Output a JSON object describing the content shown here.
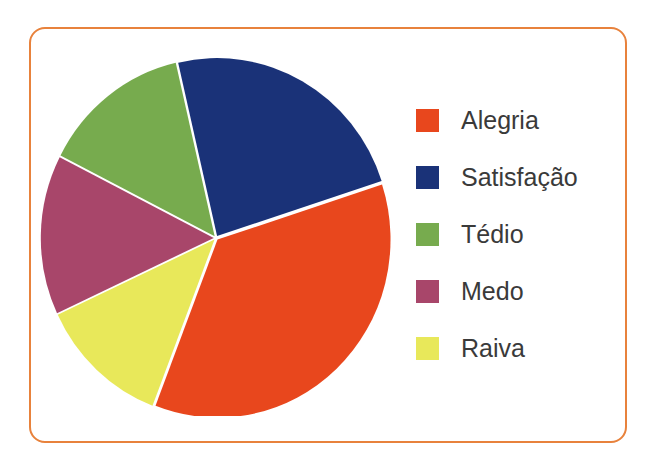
{
  "frame": {
    "border_color": "#e8823c",
    "background": "#ffffff"
  },
  "legend": {
    "items": [
      {
        "label": "Alegria",
        "color": "#e8471d"
      },
      {
        "label": "Satisfação",
        "color": "#1a3278"
      },
      {
        "label": "Tédio",
        "color": "#77ab4e"
      },
      {
        "label": "Medo",
        "color": "#a8466a"
      },
      {
        "label": "Raiva",
        "color": "#e8e85a"
      }
    ]
  },
  "chart_data": {
    "type": "pie",
    "title": "",
    "subtitle": "",
    "xlabel": "",
    "ylabel": "",
    "legend_position": "right",
    "grid": false,
    "labels": [
      "Alegria",
      "Satisfação",
      "Tédio",
      "Medo",
      "Raiva"
    ],
    "colors": [
      "#e8471d",
      "#1a3278",
      "#77ab4e",
      "#a8466a",
      "#e8e85a"
    ],
    "values": [
      36,
      24,
      14,
      15,
      12
    ],
    "units": "percent",
    "slice_angles_deg": [
      129,
      85,
      50,
      52,
      44
    ],
    "start_angle_deg": 72,
    "direction": "clockwise",
    "slices": [
      {
        "label": "Alegria",
        "color": "#e8471d",
        "value": 36,
        "start_deg": 72,
        "end_deg": 201
      },
      {
        "label": "Raiva",
        "color": "#e8e85a",
        "value": 12,
        "start_deg": 201,
        "end_deg": 245
      },
      {
        "label": "Medo",
        "color": "#a8466a",
        "value": 15,
        "start_deg": 245,
        "end_deg": 297
      },
      {
        "label": "Tédio",
        "color": "#77ab4e",
        "value": 14,
        "start_deg": 297,
        "end_deg": 347
      },
      {
        "label": "Satisfação",
        "color": "#1a3278",
        "value": 24,
        "start_deg": 347,
        "end_deg": 432
      }
    ]
  }
}
